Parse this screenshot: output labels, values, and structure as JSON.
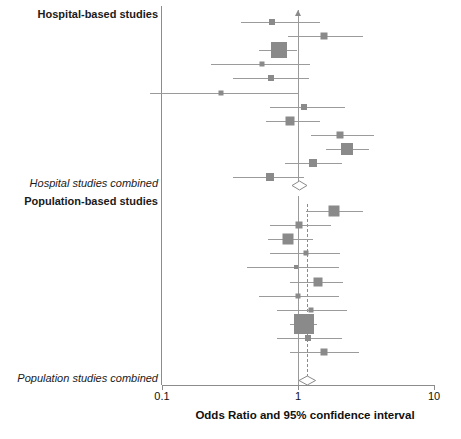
{
  "chart_data": {
    "type": "forest",
    "title": "",
    "xlabel": "Odds Ratio and 95% confidence interval",
    "xscale": "log",
    "xlim": [
      0.1,
      10
    ],
    "xticks": [
      0.1,
      1,
      10
    ],
    "xtick_labels": [
      "0.1",
      "1",
      "10"
    ],
    "null_value": 1,
    "marker_color": "#8a8a8a",
    "line_color": "#9b9b9b",
    "axis_color": "#8c8c8c",
    "groups": [
      {
        "label": "Hospital-based studies",
        "type": "group-header",
        "studies": [
          {
            "or": 0.64,
            "lcl": 0.38,
            "ucl": 1.45,
            "size": 6,
            "clipped_upper": false
          },
          {
            "or": 1.55,
            "lcl": 0.85,
            "ucl": 3.0,
            "size": 7,
            "clipped_upper": false
          },
          {
            "or": 0.72,
            "lcl": 0.52,
            "ucl": 0.98,
            "size": 16,
            "clipped_upper": false
          },
          {
            "or": 0.54,
            "lcl": 0.23,
            "ucl": 1.23,
            "size": 5,
            "clipped_upper": false
          },
          {
            "or": 0.63,
            "lcl": 0.33,
            "ucl": 1.2,
            "size": 6,
            "clipped_upper": false
          },
          {
            "or": 0.27,
            "lcl": 0.08,
            "ucl": 1.0,
            "size": 5,
            "clipped_upper": false
          },
          {
            "or": 1.1,
            "lcl": 0.62,
            "ucl": 2.2,
            "size": 6,
            "clipped_upper": false
          },
          {
            "or": 0.87,
            "lcl": 0.58,
            "ucl": 1.45,
            "size": 9,
            "clipped_upper": false
          },
          {
            "or": 2.05,
            "lcl": 1.25,
            "ucl": 3.6,
            "size": 7,
            "clipped_upper": false
          },
          {
            "or": 2.3,
            "lcl": 1.6,
            "ucl": 3.3,
            "size": 12,
            "clipped_upper": false
          },
          {
            "or": 1.28,
            "lcl": 0.8,
            "ucl": 2.1,
            "size": 8,
            "clipped_upper": false
          },
          {
            "or": 0.62,
            "lcl": 0.33,
            "ucl": 1.1,
            "size": 8,
            "clipped_upper": false
          }
        ],
        "summary": {
          "label": "Hospital studies combined",
          "or": 1.02,
          "lcl": 0.9,
          "ucl": 1.16
        }
      },
      {
        "label": "Population-based studies",
        "type": "group-header",
        "studies": [
          {
            "or": 1.85,
            "lcl": 1.15,
            "ucl": 3.0,
            "size": 11,
            "clipped_upper": false
          },
          {
            "or": 1.02,
            "lcl": 0.62,
            "ucl": 1.75,
            "size": 7,
            "clipped_upper": false
          },
          {
            "or": 0.85,
            "lcl": 0.6,
            "ucl": 1.28,
            "size": 11,
            "clipped_upper": false
          },
          {
            "or": 1.15,
            "lcl": 0.62,
            "ucl": 2.05,
            "size": 5,
            "clipped_upper": false
          },
          {
            "or": 0.96,
            "lcl": 0.42,
            "ucl": 2.0,
            "size": 4,
            "clipped_upper": false
          },
          {
            "or": 1.4,
            "lcl": 0.88,
            "ucl": 2.15,
            "size": 9,
            "clipped_upper": false
          },
          {
            "or": 1.0,
            "lcl": 0.52,
            "ucl": 2.0,
            "size": 5,
            "clipped_upper": false
          },
          {
            "or": 1.24,
            "lcl": 0.7,
            "ucl": 2.3,
            "size": 5,
            "clipped_upper": false
          },
          {
            "or": 1.1,
            "lcl": 0.88,
            "ucl": 1.38,
            "size": 20,
            "clipped_upper": false
          },
          {
            "or": 1.18,
            "lcl": 0.7,
            "ucl": 2.1,
            "size": 6,
            "clipped_upper": false
          },
          {
            "or": 1.55,
            "lcl": 0.88,
            "ucl": 2.8,
            "size": 7,
            "clipped_upper": false
          }
        ],
        "summary": {
          "label": "Population studies combined",
          "or": 1.17,
          "lcl": 1.02,
          "ucl": 1.35
        }
      }
    ]
  },
  "labels": {
    "hospital_group": "Hospital-based studies",
    "hospital_summary": "Hospital studies combined",
    "population_group": "Population-based studies",
    "population_summary": "Population studies combined",
    "axis_title": "Odds Ratio and 95% confidence interval",
    "tick_low": "0.1",
    "tick_mid": "1",
    "tick_high": "10"
  }
}
